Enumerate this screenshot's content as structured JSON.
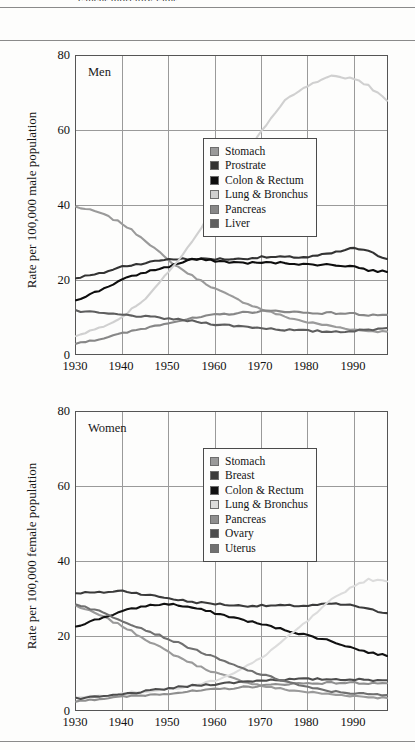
{
  "page": {
    "cut_header_text": "cancer mortality rates",
    "rules": [
      "top-rule",
      "under-header-rule",
      "bottom-rule"
    ]
  },
  "charts": [
    {
      "id": "men",
      "panel_label": "Men",
      "ylabel": "Rate per 100,000 male population",
      "yticks": [
        0,
        20,
        40,
        60,
        80
      ],
      "xticks": [
        1930,
        1940,
        1950,
        1960,
        1970,
        1980,
        1990
      ],
      "legend": [
        {
          "label": "Stomach",
          "color": "#9a9a9a"
        },
        {
          "label": "Prostrate",
          "color": "#333333"
        },
        {
          "label": "Colon & Rectum",
          "color": "#0d0d0d"
        },
        {
          "label": "Lung & Bronchus",
          "color": "#d0d0d0"
        },
        {
          "label": "Pancreas",
          "color": "#878787"
        },
        {
          "label": "Liver",
          "color": "#5e5e5e"
        }
      ]
    },
    {
      "id": "women",
      "panel_label": "Women",
      "ylabel": "Rate per 100,000 female population",
      "yticks": [
        0,
        20,
        40,
        60,
        80
      ],
      "xticks": [
        1930,
        1940,
        1950,
        1960,
        1970,
        1980,
        1990
      ],
      "legend": [
        {
          "label": "Stomach",
          "color": "#9a9a9a"
        },
        {
          "label": "Breast",
          "color": "#3b3b3b"
        },
        {
          "label": "Colon & Rectum",
          "color": "#111111"
        },
        {
          "label": "Lung & Bronchus",
          "color": "#dcdcdc"
        },
        {
          "label": "Pancreas",
          "color": "#8f8f8f"
        },
        {
          "label": "Ovary",
          "color": "#4d4d4d"
        },
        {
          "label": "Uterus",
          "color": "#707070"
        }
      ]
    }
  ],
  "chart_data": [
    {
      "type": "line",
      "title": "Men",
      "xlabel": "",
      "ylabel": "Rate per 100,000 male population",
      "xlim": [
        1930,
        1997
      ],
      "ylim": [
        0,
        80
      ],
      "grid": true,
      "legend_position": "center-right",
      "x": [
        1930,
        1935,
        1940,
        1945,
        1950,
        1955,
        1960,
        1965,
        1970,
        1975,
        1980,
        1985,
        1990,
        1993,
        1997
      ],
      "series": [
        {
          "name": "Stomach",
          "color": "#9a9a9a",
          "values": [
            39.5,
            38.0,
            35.0,
            30.5,
            25.0,
            21.0,
            17.5,
            14.5,
            12.0,
            10.0,
            8.5,
            7.5,
            6.5,
            6.2,
            6.0
          ]
        },
        {
          "name": "Prostrate",
          "color": "#333333",
          "values": [
            20.5,
            21.5,
            23.5,
            24.5,
            25.5,
            25.5,
            25.5,
            25.5,
            26.0,
            26.0,
            26.0,
            27.0,
            28.5,
            27.5,
            25.5
          ]
        },
        {
          "name": "Colon & Rectum",
          "color": "#0d0d0d",
          "values": [
            14.5,
            17.0,
            20.0,
            22.0,
            23.5,
            25.5,
            25.0,
            24.5,
            24.5,
            24.5,
            24.0,
            24.0,
            23.5,
            22.5,
            22.0
          ]
        },
        {
          "name": "Lung & Bronchus",
          "color": "#d0d0d0",
          "values": [
            5.0,
            7.0,
            10.0,
            15.0,
            22.0,
            30.0,
            40.0,
            50.0,
            60.0,
            68.0,
            72.0,
            74.5,
            74.0,
            72.0,
            68.0
          ]
        },
        {
          "name": "Pancreas",
          "color": "#878787",
          "values": [
            3.0,
            4.0,
            5.5,
            7.0,
            8.5,
            9.5,
            10.5,
            11.0,
            11.5,
            11.5,
            11.0,
            11.0,
            10.8,
            10.5,
            10.5
          ]
        },
        {
          "name": "Liver",
          "color": "#5e5e5e",
          "values": [
            11.5,
            11.0,
            10.5,
            10.0,
            9.5,
            8.8,
            8.0,
            7.5,
            7.0,
            6.5,
            6.2,
            6.0,
            6.2,
            6.5,
            7.0
          ]
        }
      ]
    },
    {
      "type": "line",
      "title": "Women",
      "xlabel": "",
      "ylabel": "Rate per 100,000 female population",
      "xlim": [
        1930,
        1997
      ],
      "ylim": [
        0,
        80
      ],
      "grid": true,
      "legend_position": "center-right",
      "x": [
        1930,
        1935,
        1940,
        1945,
        1950,
        1955,
        1960,
        1965,
        1970,
        1975,
        1980,
        1985,
        1990,
        1993,
        1997
      ],
      "series": [
        {
          "name": "Stomach",
          "color": "#9a9a9a",
          "values": [
            28.0,
            25.5,
            22.5,
            19.0,
            15.5,
            12.5,
            10.0,
            8.0,
            6.5,
            5.5,
            4.8,
            4.2,
            3.8,
            3.5,
            3.2
          ]
        },
        {
          "name": "Breast",
          "color": "#3b3b3b",
          "values": [
            31.5,
            31.5,
            32.0,
            31.0,
            30.0,
            29.0,
            28.5,
            28.0,
            28.0,
            28.0,
            28.0,
            28.5,
            28.0,
            27.0,
            26.0
          ]
        },
        {
          "name": "Colon & Rectum",
          "color": "#111111",
          "values": [
            22.5,
            24.5,
            26.5,
            28.0,
            28.5,
            27.5,
            26.0,
            24.5,
            23.0,
            21.5,
            20.0,
            18.5,
            16.5,
            15.5,
            14.5
          ]
        },
        {
          "name": "Lung & Bronchus",
          "color": "#dcdcdc",
          "values": [
            3.5,
            3.8,
            4.5,
            5.0,
            5.5,
            6.5,
            8.0,
            10.5,
            14.0,
            19.0,
            24.0,
            29.5,
            33.5,
            35.0,
            34.5
          ]
        },
        {
          "name": "Pancreas",
          "color": "#8f8f8f",
          "values": [
            2.5,
            3.0,
            3.5,
            4.0,
            4.5,
            5.0,
            5.5,
            6.0,
            6.5,
            7.0,
            7.2,
            7.3,
            7.3,
            7.2,
            7.2
          ]
        },
        {
          "name": "Ovary",
          "color": "#4d4d4d",
          "values": [
            3.0,
            3.5,
            4.2,
            5.0,
            5.8,
            6.5,
            7.0,
            7.5,
            8.0,
            8.2,
            8.3,
            8.3,
            8.2,
            8.0,
            8.0
          ]
        },
        {
          "name": "Uterus",
          "color": "#707070",
          "values": [
            28.5,
            26.5,
            24.0,
            21.5,
            19.0,
            16.5,
            14.0,
            11.5,
            9.5,
            7.8,
            6.0,
            5.0,
            4.5,
            4.2,
            4.0
          ]
        }
      ]
    }
  ]
}
